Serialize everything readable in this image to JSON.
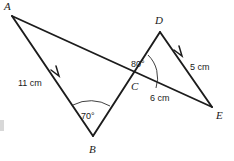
{
  "figure": {
    "kind": "geometry-diagram",
    "background_color": "#ffffff",
    "stroke_color": "#1c1c1c",
    "vertices": [
      {
        "name": "A",
        "label": "A",
        "x": 12,
        "y": 16,
        "label_x": 4,
        "label_y": 10
      },
      {
        "name": "B",
        "label": "B",
        "x": 93,
        "y": 136,
        "label_x": 89,
        "label_y": 153
      },
      {
        "name": "C",
        "label": "C",
        "x": 137,
        "y": 80,
        "label_x": 131,
        "label_y": 90
      },
      {
        "name": "D",
        "label": "D",
        "x": 160,
        "y": 32,
        "label_x": 155,
        "label_y": 24
      },
      {
        "name": "E",
        "label": "E",
        "x": 212,
        "y": 107,
        "label_x": 216,
        "label_y": 119
      }
    ],
    "segments": [
      {
        "name": "segment-A-E",
        "from": "A",
        "to": "E"
      },
      {
        "name": "segment-A-B",
        "from": "A",
        "to": "B"
      },
      {
        "name": "segment-B-D",
        "from": "B",
        "to": "D"
      },
      {
        "name": "segment-D-E",
        "from": "D",
        "to": "E"
      }
    ],
    "measurements": [
      {
        "name": "length-AB",
        "text": "11 cm",
        "x": 18,
        "y": 86,
        "on_segment": "segment-A-B"
      },
      {
        "name": "length-DE",
        "text": "5 cm",
        "x": 190,
        "y": 70,
        "on_segment": "segment-D-E"
      },
      {
        "name": "length-CE",
        "text": "6 cm",
        "x": 150,
        "y": 101,
        "on_segment": "segment-A-E"
      }
    ],
    "angles": [
      {
        "name": "angle-at-B",
        "text": "70°",
        "vertex": "B",
        "x": 81,
        "y": 119
      },
      {
        "name": "angle-at-C",
        "text": "80°",
        "vertex": "C",
        "x": 131,
        "y": 67
      }
    ],
    "direction_arrows": [
      {
        "name": "arrow-on-AB",
        "x": 57,
        "y": 75,
        "points_toward": "A"
      },
      {
        "name": "arrow-on-DE",
        "x": 180,
        "y": 55,
        "points_toward": "D"
      }
    ]
  }
}
